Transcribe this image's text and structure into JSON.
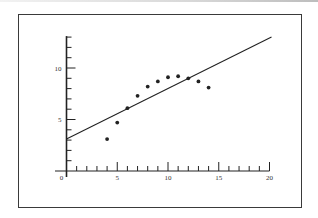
{
  "chart_data": {
    "type": "scatter",
    "title": "",
    "xlabel": "",
    "ylabel": "",
    "xlim": [
      0,
      20
    ],
    "ylim": [
      0,
      13
    ],
    "x_ticks_major": [
      0,
      5,
      10,
      15,
      20
    ],
    "x_tick_labels": [
      "0",
      "5",
      "10",
      "15",
      "20"
    ],
    "y_ticks_major": [
      5,
      10
    ],
    "y_tick_labels": [
      "5",
      "10"
    ],
    "minor_tick_step": 1,
    "grid": false,
    "legend": null,
    "series": [
      {
        "name": "points",
        "kind": "scatter",
        "x": [
          4,
          5,
          6,
          7,
          8,
          9,
          10,
          11,
          12,
          13,
          14
        ],
        "y": [
          3.1,
          4.7,
          6.1,
          7.3,
          8.2,
          8.7,
          9.1,
          9.2,
          9.0,
          8.7,
          8.1
        ]
      },
      {
        "name": "fit-line",
        "kind": "line",
        "x": [
          0,
          20.2
        ],
        "y": [
          3.1,
          13.0
        ]
      }
    ]
  },
  "colors": {
    "ink": "#222222",
    "frame": "#3a3a3a",
    "background": "#ffffff"
  }
}
